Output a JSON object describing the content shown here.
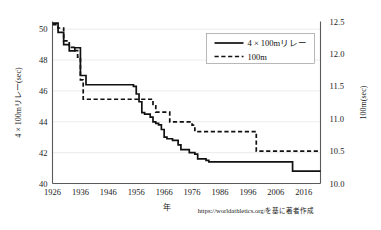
{
  "chart_data": {
    "type": "line",
    "title": "",
    "xlabel": "年",
    "ylabel": "4 × 100mリレー(sec)",
    "y2label": "100m(sec)",
    "xlim": [
      1926,
      2022
    ],
    "ylim": [
      40,
      50.5
    ],
    "y2lim": [
      10.0,
      12.5
    ],
    "grid": true,
    "legend_position": "top-right",
    "xticks": [
      1926,
      1936,
      1946,
      1956,
      1966,
      1976,
      1986,
      1996,
      2006,
      2016
    ],
    "xtick_labels": [
      "1926",
      "1936",
      "1946",
      "1956",
      "1966",
      "1976",
      "1986",
      "1996",
      "2006",
      "2016"
    ],
    "yticks": [
      40,
      42,
      44,
      46,
      48,
      50
    ],
    "ytick_labels": [
      "40",
      "42",
      "44",
      "46",
      "48",
      "50"
    ],
    "y2ticks": [
      10.0,
      10.5,
      11.0,
      11.5,
      12.0,
      12.5
    ],
    "y2tick_labels": [
      "10.0",
      "10.5",
      "11.0",
      "11.5",
      "12.0",
      "12.5"
    ],
    "series": [
      {
        "name": "4 × 100mリレー",
        "axis": "left",
        "style": "solid",
        "units": "sec",
        "points": [
          [
            1926,
            50.4
          ],
          [
            1927,
            50.4
          ],
          [
            1928,
            49.8
          ],
          [
            1929,
            49.8
          ],
          [
            1930,
            49.0
          ],
          [
            1931,
            49.0
          ],
          [
            1932,
            48.6
          ],
          [
            1933,
            48.6
          ],
          [
            1934,
            48.8
          ],
          [
            1935,
            48.8
          ],
          [
            1936,
            47.0
          ],
          [
            1937,
            47.0
          ],
          [
            1938,
            46.4
          ],
          [
            1946,
            46.4
          ],
          [
            1947,
            46.4
          ],
          [
            1954,
            46.4
          ],
          [
            1955,
            46.3
          ],
          [
            1956,
            45.8
          ],
          [
            1957,
            45.3
          ],
          [
            1958,
            44.6
          ],
          [
            1959,
            44.5
          ],
          [
            1960,
            44.5
          ],
          [
            1961,
            44.3
          ],
          [
            1962,
            44.0
          ],
          [
            1963,
            43.9
          ],
          [
            1964,
            43.8
          ],
          [
            1965,
            43.5
          ],
          [
            1966,
            43.0
          ],
          [
            1967,
            42.9
          ],
          [
            1968,
            42.9
          ],
          [
            1969,
            42.8
          ],
          [
            1970,
            42.8
          ],
          [
            1971,
            42.5
          ],
          [
            1972,
            42.2
          ],
          [
            1973,
            42.2
          ],
          [
            1974,
            42.2
          ],
          [
            1975,
            42.0
          ],
          [
            1976,
            42.0
          ],
          [
            1977,
            41.9
          ],
          [
            1978,
            41.6
          ],
          [
            1979,
            41.6
          ],
          [
            1980,
            41.6
          ],
          [
            1981,
            41.5
          ],
          [
            1982,
            41.4
          ],
          [
            1983,
            41.4
          ],
          [
            1984,
            41.4
          ],
          [
            1985,
            41.4
          ],
          [
            1992,
            41.4
          ],
          [
            1993,
            41.4
          ],
          [
            2008,
            41.4
          ],
          [
            2009,
            41.4
          ],
          [
            2010,
            41.4
          ],
          [
            2011,
            41.4
          ],
          [
            2012,
            40.8
          ],
          [
            2013,
            40.8
          ],
          [
            2016,
            40.8
          ],
          [
            2022,
            40.8
          ]
        ]
      },
      {
        "name": "100m",
        "axis": "right",
        "style": "dashed",
        "units": "sec",
        "points": [
          [
            1926,
            12.45
          ],
          [
            1927,
            12.45
          ],
          [
            1928,
            12.4
          ],
          [
            1929,
            12.4
          ],
          [
            1930,
            12.2
          ],
          [
            1931,
            12.2
          ],
          [
            1932,
            12.1
          ],
          [
            1933,
            12.1
          ],
          [
            1934,
            12.05
          ],
          [
            1935,
            11.95
          ],
          [
            1936,
            11.6
          ],
          [
            1937,
            11.3
          ],
          [
            1938,
            11.3
          ],
          [
            1946,
            11.3
          ],
          [
            1956,
            11.3
          ],
          [
            1957,
            11.3
          ],
          [
            1958,
            11.3
          ],
          [
            1959,
            11.3
          ],
          [
            1960,
            11.3
          ],
          [
            1961,
            11.3
          ],
          [
            1962,
            11.2
          ],
          [
            1963,
            11.1
          ],
          [
            1964,
            11.1
          ],
          [
            1965,
            11.1
          ],
          [
            1966,
            11.1
          ],
          [
            1967,
            11.1
          ],
          [
            1968,
            10.95
          ],
          [
            1969,
            10.95
          ],
          [
            1970,
            10.95
          ],
          [
            1971,
            10.95
          ],
          [
            1972,
            10.95
          ],
          [
            1973,
            10.95
          ],
          [
            1974,
            10.95
          ],
          [
            1975,
            10.95
          ],
          [
            1976,
            10.9
          ],
          [
            1977,
            10.8
          ],
          [
            1978,
            10.8
          ],
          [
            1984,
            10.8
          ],
          [
            1988,
            10.8
          ],
          [
            1992,
            10.8
          ],
          [
            1996,
            10.8
          ],
          [
            1997,
            10.8
          ],
          [
            1998,
            10.8
          ],
          [
            1999,
            10.5
          ],
          [
            2000,
            10.5
          ],
          [
            2006,
            10.5
          ],
          [
            2009,
            10.5
          ],
          [
            2016,
            10.5
          ],
          [
            2022,
            10.5
          ]
        ]
      }
    ],
    "source_note": "https://worldathletics.org/を基に著者作成"
  },
  "legend": {
    "items": [
      {
        "label": "4 × 100mリレー",
        "style": "solid"
      },
      {
        "label": "100m",
        "style": "dashed"
      }
    ]
  }
}
